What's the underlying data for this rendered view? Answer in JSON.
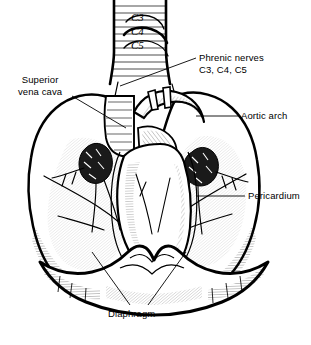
{
  "figure": {
    "background_color": "#ffffff",
    "ink_color": "#000000",
    "width": 311,
    "height": 345
  },
  "labels": {
    "phrenic": {
      "line1": "Phrenic nerves",
      "line2": "C3, C4, C5"
    },
    "superior_vena_cava": {
      "line1": "Superior",
      "line2": "vena cava"
    },
    "aortic_arch": "Aortic arch",
    "pericardium": "Pericardium",
    "diaphragm": "Diaphragm"
  },
  "nerve_roots": [
    {
      "id": "c3",
      "text": "C3"
    },
    {
      "id": "c4",
      "text": "C4"
    },
    {
      "id": "c5",
      "text": "C5"
    }
  ]
}
